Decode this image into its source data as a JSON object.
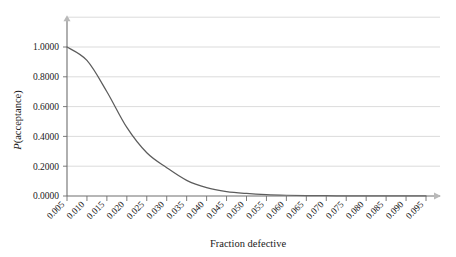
{
  "chart_data": {
    "type": "line",
    "title": "",
    "xlabel": "Fraction defective",
    "ylabel": "P(acceptance)",
    "grid": true,
    "legend": false,
    "xlim": [
      0.0025,
      0.0975
    ],
    "ylim": [
      0.0,
      1.2
    ],
    "y_ticks": [
      "0.0000",
      "0.2000",
      "0.4000",
      "0.6000",
      "0.8000",
      "1.0000"
    ],
    "y_tick_values": [
      0.0,
      0.2,
      0.4,
      0.6,
      0.8,
      1.0
    ],
    "x_ticks": [
      "0.005",
      "0.010",
      "0.015",
      "0.020",
      "0.025",
      "0.030",
      "0.035",
      "0.040",
      "0.045",
      "0.050",
      "0.055",
      "0.060",
      "0.065",
      "0.070",
      "0.075",
      "0.080",
      "0.085",
      "0.090",
      "0.095"
    ],
    "x_tick_values": [
      0.005,
      0.01,
      0.015,
      0.02,
      0.025,
      0.03,
      0.035,
      0.04,
      0.045,
      0.05,
      0.055,
      0.06,
      0.065,
      0.07,
      0.075,
      0.08,
      0.085,
      0.09,
      0.095
    ],
    "series": [
      {
        "name": "Operating characteristic curve",
        "color": "#5c5c5c",
        "x": [
          0.005,
          0.01,
          0.015,
          0.02,
          0.025,
          0.03,
          0.035,
          0.04,
          0.045,
          0.05,
          0.055,
          0.06,
          0.065,
          0.07,
          0.075,
          0.08,
          0.085,
          0.09,
          0.095
        ],
        "values": [
          1.0,
          0.91,
          0.7,
          0.46,
          0.29,
          0.19,
          0.105,
          0.056,
          0.03,
          0.017,
          0.009,
          0.005,
          0.003,
          0.002,
          0.0012,
          0.0008,
          0.0005,
          0.0003,
          0.0002
        ]
      }
    ],
    "axis_arrows": {
      "y_axis_top": "up-arrow",
      "x_axis_right": "right-arrow"
    }
  }
}
